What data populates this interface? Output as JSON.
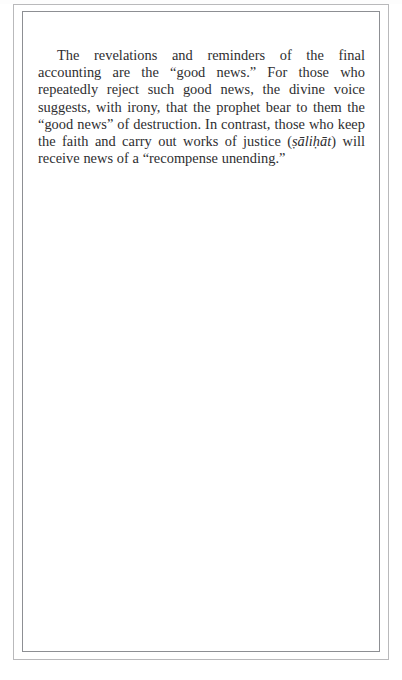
{
  "page": {
    "width": 402,
    "height": 680,
    "background_color": "#ffffff",
    "frame": {
      "outer_color": "#b9b9bb",
      "inner_color": "#8d8f93"
    }
  },
  "body": {
    "paragraph": {
      "segment_1": "The revelations and reminders of the final accounting are the “good news.” For those who repeatedly reject such good news, the divine voice suggests, with irony, that the prophet bear to them the “good news” of destruction. In contrast, those who keep the faith and carry out works of justice (",
      "transliteration": "ṣāliḥāt",
      "segment_2": ") will receive news of a “recompense unending.”"
    },
    "text_color": "#2e2e30"
  }
}
